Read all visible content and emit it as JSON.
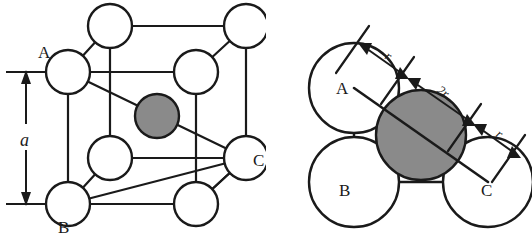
{
  "figure": {
    "stroke_color": "#1a1a1a",
    "corner_atom_fill": "#ffffff",
    "center_atom_fill": "#8a8a8a",
    "background": "#ffffff"
  },
  "left_panel": {
    "name": "bcc-unit-cell",
    "labels": {
      "corner_a": "A",
      "corner_b": "B",
      "corner_c": "C",
      "edge_length": "a"
    },
    "dimension": {
      "name": "lattice-parameter",
      "symbol": "a",
      "description": "cube edge length"
    },
    "corner_atom_count": 8,
    "center_atom_count": 1
  },
  "right_panel": {
    "name": "body-diagonal-cross-section",
    "labels": {
      "corner_a": "A",
      "corner_b": "B",
      "corner_c": "C"
    },
    "dimensions": [
      {
        "name": "radius-left",
        "symbol": "r"
      },
      {
        "name": "diameter-center",
        "symbol": "2r"
      },
      {
        "name": "radius-right",
        "symbol": "r"
      }
    ],
    "corner_atom_count": 4,
    "center_atom_count": 1
  }
}
